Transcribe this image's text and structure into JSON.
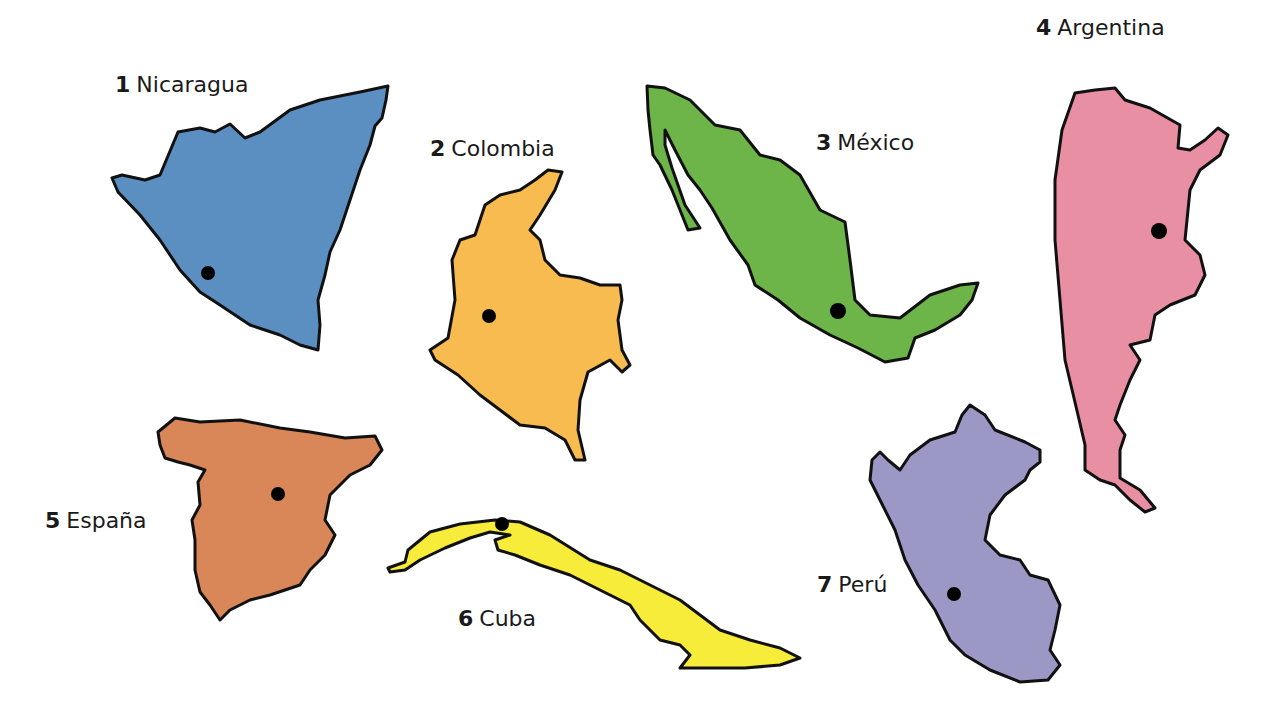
{
  "countries": [
    {
      "num": "1",
      "name": "Nicaragua",
      "color": "#5b8fc2"
    },
    {
      "num": "2",
      "name": "Colombia",
      "color": "#f7bb4f"
    },
    {
      "num": "3",
      "name": "México",
      "color": "#6db548"
    },
    {
      "num": "4",
      "name": "Argentina",
      "color": "#e88fa3"
    },
    {
      "num": "5",
      "name": "España",
      "color": "#d98659"
    },
    {
      "num": "6",
      "name": "Cuba",
      "color": "#f8ec3a"
    },
    {
      "num": "7",
      "name": "Perú",
      "color": "#9c98c6"
    }
  ],
  "capital_marker_color": "#000000"
}
